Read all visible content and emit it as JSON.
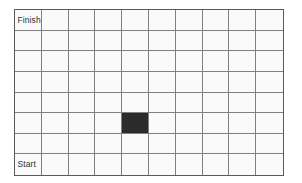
{
  "board": {
    "name": "maze-grid",
    "columns": 10,
    "rows": 8,
    "cell_fill_color": "#fafafa",
    "grid_line_color": "#808080",
    "border_color": "#5a5a5a",
    "filled_cell_color": "#2b2b2b",
    "label_color": "#303030",
    "labels": {
      "finish": "Finish",
      "start": "Start"
    },
    "label_cells": [
      {
        "row": 1,
        "col": 1,
        "text": "Finish"
      },
      {
        "row": 8,
        "col": 1,
        "text": "Start"
      }
    ],
    "filled_cells": [
      {
        "row": 6,
        "col": 5
      }
    ]
  },
  "chart_data": {
    "type": "heatmap",
    "title": "",
    "xlabel": "",
    "ylabel": "",
    "columns": 10,
    "rows": 8,
    "grid": true,
    "legend": "none",
    "categories_x": [
      "1",
      "2",
      "3",
      "4",
      "5",
      "6",
      "7",
      "8",
      "9",
      "10"
    ],
    "categories_y": [
      "1",
      "2",
      "3",
      "4",
      "5",
      "6",
      "7",
      "8"
    ],
    "values": [
      [
        0,
        0,
        0,
        0,
        0,
        0,
        0,
        0,
        0,
        0
      ],
      [
        0,
        0,
        0,
        0,
        0,
        0,
        0,
        0,
        0,
        0
      ],
      [
        0,
        0,
        0,
        0,
        0,
        0,
        0,
        0,
        0,
        0
      ],
      [
        0,
        0,
        0,
        0,
        0,
        0,
        0,
        0,
        0,
        0
      ],
      [
        0,
        0,
        0,
        0,
        0,
        0,
        0,
        0,
        0,
        0
      ],
      [
        0,
        0,
        0,
        0,
        1,
        0,
        0,
        0,
        0,
        0
      ],
      [
        0,
        0,
        0,
        0,
        0,
        0,
        0,
        0,
        0,
        0
      ],
      [
        0,
        0,
        0,
        0,
        0,
        0,
        0,
        0,
        0,
        0
      ]
    ],
    "annotations": [
      {
        "row": 1,
        "col": 1,
        "text": "Finish"
      },
      {
        "row": 8,
        "col": 1,
        "text": "Start"
      }
    ]
  }
}
